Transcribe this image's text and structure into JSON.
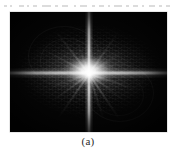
{
  "page": {
    "background_color": "#ffffff",
    "cutoff_text_line": ""
  },
  "figure": {
    "caption": "(a)",
    "panel_label": "a",
    "image": {
      "kind": "fourier-magnitude-spectrum",
      "background_color": "#050505",
      "highlight_color": "#ffffff",
      "description": "2D Fourier transform magnitude spectrum with bright central cross",
      "center": {
        "x_pct": 50,
        "y_pct": 50.5
      },
      "features": {
        "horizontal_beam": true,
        "vertical_beam": true,
        "diagonal_rays": 10,
        "moire_texture": true,
        "corner_vignette": true
      }
    }
  },
  "chart_data": {
    "type": "heatmap",
    "title": "(a)",
    "xlabel": "",
    "ylabel": "",
    "colormap": "grayscale",
    "value_range": [
      0,
      255
    ]
  },
  "rays": [
    {
      "angle": 18,
      "length": 50,
      "opacity": 0.48
    },
    {
      "angle": 37,
      "length": 44,
      "opacity": 0.4
    },
    {
      "angle": 56,
      "length": 56,
      "opacity": 0.52
    },
    {
      "angle": 72,
      "length": 48,
      "opacity": 0.42
    },
    {
      "angle": 125,
      "length": 54,
      "opacity": 0.5
    },
    {
      "angle": 143,
      "length": 46,
      "opacity": 0.42
    },
    {
      "angle": 161,
      "length": 42,
      "opacity": 0.36
    },
    {
      "angle": 208,
      "length": 50,
      "opacity": 0.44
    },
    {
      "angle": 232,
      "length": 56,
      "opacity": 0.5
    },
    {
      "angle": 305,
      "length": 52,
      "opacity": 0.46
    },
    {
      "angle": 325,
      "length": 44,
      "opacity": 0.38
    },
    {
      "angle": 250,
      "length": 40,
      "opacity": 0.34
    }
  ],
  "arcs": [
    {
      "left": 18,
      "top": 14,
      "w": 70,
      "h": 58,
      "opacity": 0.2
    },
    {
      "left": 30,
      "top": 26,
      "w": 52,
      "h": 44,
      "opacity": 0.16
    },
    {
      "left": 76,
      "top": 52,
      "w": 66,
      "h": 56,
      "opacity": 0.18
    },
    {
      "left": 84,
      "top": 62,
      "w": 48,
      "h": 40,
      "opacity": 0.14
    }
  ],
  "cutoff_fragments": [
    {
      "left": 4,
      "width": 3
    },
    {
      "left": 10,
      "width": 2
    },
    {
      "left": 19,
      "width": 5
    },
    {
      "left": 27,
      "width": 2
    },
    {
      "left": 33,
      "width": 4
    },
    {
      "left": 42,
      "width": 9
    },
    {
      "left": 55,
      "width": 3
    },
    {
      "left": 62,
      "width": 6
    },
    {
      "left": 74,
      "width": 2
    },
    {
      "left": 80,
      "width": 7
    },
    {
      "left": 92,
      "width": 3
    },
    {
      "left": 99,
      "width": 5
    },
    {
      "left": 108,
      "width": 2
    },
    {
      "left": 114,
      "width": 8
    },
    {
      "left": 126,
      "width": 3
    },
    {
      "left": 133,
      "width": 5
    },
    {
      "left": 142,
      "width": 2
    },
    {
      "left": 149,
      "width": 6
    },
    {
      "left": 159,
      "width": 3
    },
    {
      "left": 166,
      "width": 4
    }
  ]
}
